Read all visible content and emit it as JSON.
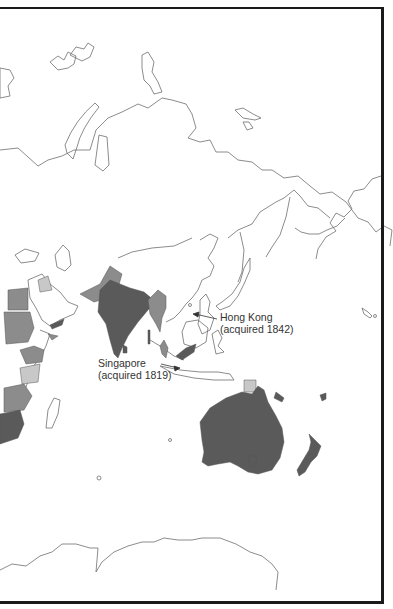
{
  "map": {
    "title": "British Empire — Asia and Oceania",
    "colors": {
      "background": "#ffffff",
      "outline": "#6e6e6e",
      "dark": "#5a5a5a",
      "medium": "#8c8c8c",
      "light": "#c8c8c8",
      "frame": "#1a1a1a"
    },
    "labels": [
      {
        "id": "hong-kong",
        "line1": "Hong Kong",
        "line2": "(acquired 1842)"
      },
      {
        "id": "singapore",
        "line1": "Singapore",
        "line2": "(acquired 1819)"
      }
    ],
    "shaded_regions": [
      {
        "name": "India",
        "shade": "dark"
      },
      {
        "name": "Pakistan",
        "shade": "medium"
      },
      {
        "name": "Burma",
        "shade": "medium"
      },
      {
        "name": "Malaya",
        "shade": "medium"
      },
      {
        "name": "North Borneo",
        "shade": "dark"
      },
      {
        "name": "Papua",
        "shade": "light"
      },
      {
        "name": "Australia",
        "shade": "dark"
      },
      {
        "name": "New Zealand",
        "shade": "dark"
      },
      {
        "name": "Egypt",
        "shade": "medium"
      },
      {
        "name": "Sudan",
        "shade": "medium"
      },
      {
        "name": "Kenya",
        "shade": "medium"
      },
      {
        "name": "Tanganyika",
        "shade": "light"
      },
      {
        "name": "Rhodesia",
        "shade": "medium"
      },
      {
        "name": "South Africa",
        "shade": "dark"
      },
      {
        "name": "Aden",
        "shade": "dark"
      },
      {
        "name": "Palestine/Transjordan",
        "shade": "light"
      }
    ]
  }
}
